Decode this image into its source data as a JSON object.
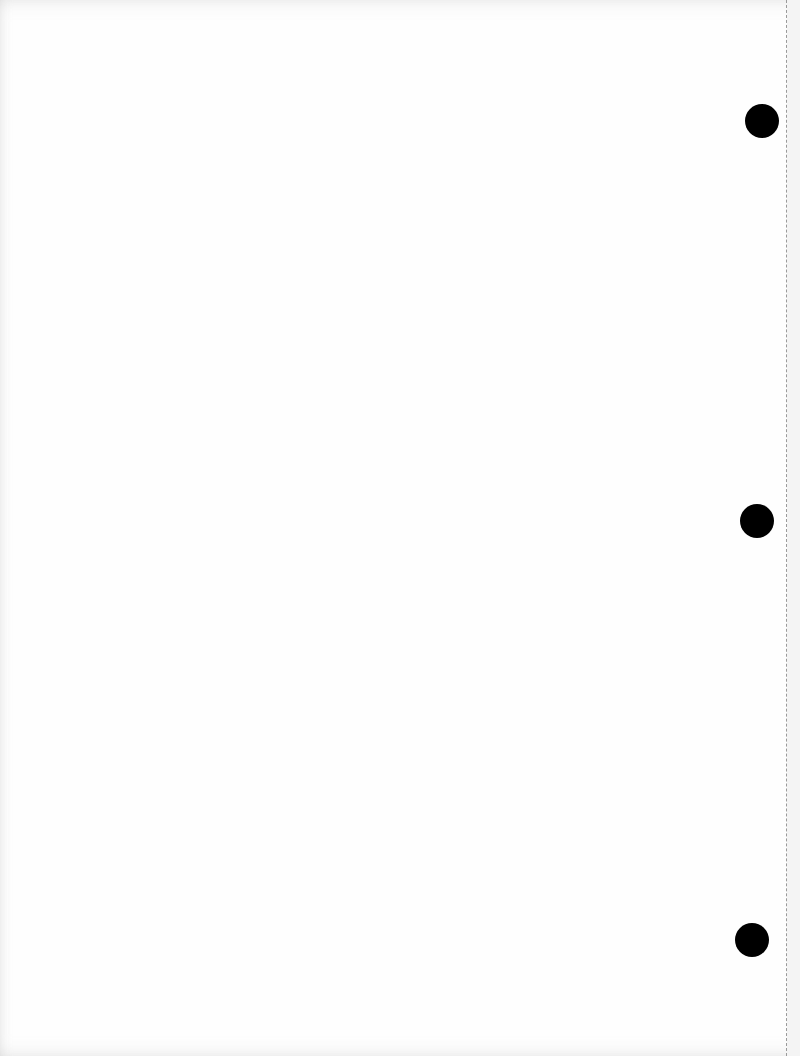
{
  "document": {
    "type": "blank-scanned-page",
    "background_color": "#fefefe",
    "punch_holes": [
      {
        "cx": 762,
        "cy": 121,
        "diameter": 34,
        "color": "#000000"
      },
      {
        "cx": 757,
        "cy": 521,
        "diameter": 34,
        "color": "#000000"
      },
      {
        "cx": 752,
        "cy": 940,
        "diameter": 34,
        "color": "#000000"
      }
    ],
    "perforation_line": {
      "x": 786,
      "style": "dashed",
      "color": "#9a9a9a"
    }
  }
}
